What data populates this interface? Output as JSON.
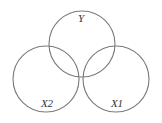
{
  "diagram": {
    "type": "venn",
    "stroke_color": "#7a7a7a",
    "background": "#ffffff",
    "sets": [
      {
        "label": "Y",
        "cx": 82,
        "cy": 44,
        "r": 33,
        "label_x": 81,
        "label_y": 22
      },
      {
        "label": "X2",
        "cx": 46,
        "cy": 79,
        "r": 33,
        "label_x": 47,
        "label_y": 107
      },
      {
        "label": "X1",
        "cx": 116,
        "cy": 79,
        "r": 33,
        "label_x": 117,
        "label_y": 107
      }
    ]
  }
}
